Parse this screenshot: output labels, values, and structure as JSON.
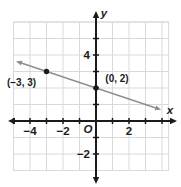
{
  "figure": {
    "kind": "coordinate-plane-graph"
  },
  "chart_data": {
    "type": "line",
    "title": "",
    "points": [
      {
        "x": -3,
        "y": 3,
        "label": "(−3, 3)",
        "label_dx": -25,
        "label_dy": 14
      },
      {
        "x": 0,
        "y": 2,
        "label": "(0, 2)",
        "label_dx": 21,
        "label_dy": -6
      }
    ],
    "line": {
      "slope": -0.33333,
      "y_intercept": 2,
      "x_start": -4.85,
      "x_end": 3.95,
      "arrows_both_ends": true
    },
    "axes": {
      "x_label": "x",
      "y_label": "y",
      "origin_label": "O",
      "grid_x": [
        -5,
        4.4
      ],
      "grid_y": [
        -3,
        6
      ],
      "tick_x": [
        -5,
        4
      ],
      "tick_y": [
        -2,
        5
      ],
      "x_labeled": [
        {
          "v": -4,
          "t": "−4"
        },
        {
          "v": -2,
          "t": "−2"
        },
        {
          "v": 2,
          "t": "2"
        }
      ],
      "y_labeled": [
        {
          "v": 4,
          "t": "4"
        },
        {
          "v": -2,
          "t": "−2"
        }
      ],
      "grid_on": true
    },
    "colors": {
      "background": "#ffffff",
      "grid": "#d9d9d9",
      "axis": "#1b1b1b",
      "line": "#8f8f8f",
      "point": "#1b1b1b",
      "label": "#1b1b1b"
    }
  }
}
